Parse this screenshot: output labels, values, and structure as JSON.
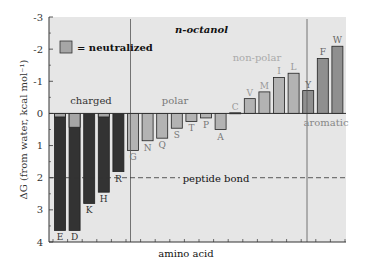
{
  "chart_data": {
    "type": "bar",
    "title": "n-octanol",
    "xlabel": "amino acid",
    "ylabel": "ΔG (from water, kcal mol⁻¹)",
    "ylim": [
      -3,
      4
    ],
    "y_inverted": true,
    "y_ticks": [
      "-3",
      "-2",
      "-1",
      "0",
      "1",
      "2",
      "3",
      "4"
    ],
    "legend": [
      {
        "label": "= neutralized",
        "color": "#a6a6a6"
      }
    ],
    "groups": [
      {
        "name": "charged",
        "categories": [
          "E",
          "D",
          "K",
          "H",
          "R"
        ]
      },
      {
        "name": "polar",
        "categories": [
          "G",
          "N",
          "Q",
          "S",
          "T",
          "P",
          "A"
        ]
      },
      {
        "name": "non-polar",
        "categories": [
          "C",
          "V",
          "M",
          "I",
          "L"
        ]
      },
      {
        "name": "aromatic",
        "categories": [
          "Y",
          "F",
          "W"
        ]
      }
    ],
    "categories": [
      "E",
      "D",
      "K",
      "H",
      "R",
      "G",
      "N",
      "Q",
      "S",
      "T",
      "P",
      "A",
      "C",
      "V",
      "M",
      "I",
      "L",
      "Y",
      "F",
      "W"
    ],
    "series": [
      {
        "name": "charged",
        "values": [
          3.64,
          3.64,
          2.8,
          2.45,
          1.81,
          null,
          null,
          null,
          null,
          null,
          null,
          null,
          null,
          null,
          null,
          null,
          null,
          null,
          null,
          null
        ]
      },
      {
        "name": "neutralized",
        "values": [
          0.11,
          0.43,
          null,
          0.11,
          null,
          null,
          null,
          null,
          null,
          null,
          null,
          null,
          null,
          null,
          null,
          null,
          null,
          null,
          null,
          null
        ]
      },
      {
        "name": "polar",
        "values": [
          null,
          null,
          null,
          null,
          null,
          1.15,
          0.85,
          0.77,
          0.46,
          0.25,
          0.14,
          0.5,
          null,
          null,
          null,
          null,
          null,
          null,
          null,
          null
        ]
      },
      {
        "name": "non-polar",
        "values": [
          null,
          null,
          null,
          null,
          null,
          null,
          null,
          null,
          null,
          null,
          null,
          null,
          -0.02,
          -0.46,
          -0.67,
          -1.12,
          -1.25,
          null,
          null,
          null
        ]
      },
      {
        "name": "aromatic",
        "values": [
          null,
          null,
          null,
          null,
          null,
          null,
          null,
          null,
          null,
          null,
          null,
          null,
          null,
          null,
          null,
          null,
          null,
          -0.71,
          -1.71,
          -2.09
        ]
      }
    ],
    "annotations": [
      {
        "text": "peptide bond",
        "y": 2.0,
        "style": "dashed"
      },
      {
        "text": "charged"
      },
      {
        "text": "polar"
      },
      {
        "text": "non-polar"
      },
      {
        "text": "aromatic"
      }
    ],
    "grid": false,
    "legend_position": "upper-left"
  },
  "colors": {
    "plot_bg": "#e6e6e6",
    "charged": "#333333",
    "neutralized": "#a6a6a6",
    "polar": "#b3b3b3",
    "nonpolar": "#b3b3b3",
    "aromatic": "#8f8f8f",
    "faint_label": "#a8a8a8"
  }
}
